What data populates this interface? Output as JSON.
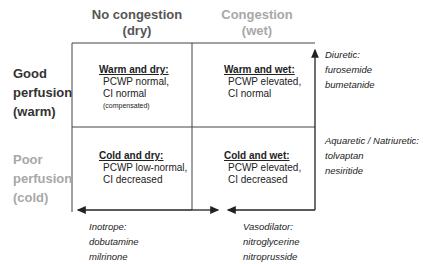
{
  "columns": [
    {
      "line1": "No congestion",
      "line2": "(dry)",
      "color": "#555555"
    },
    {
      "line1": "Congestion",
      "line2": "(wet)",
      "color": "#a8a8a8"
    }
  ],
  "rows": [
    {
      "line1": "Good",
      "line2": "perfusion",
      "line3": "(warm)",
      "color": "#333333"
    },
    {
      "line1": "Poor",
      "line2": "perfusion",
      "line3": "(cold)",
      "color": "#a8a8a8"
    }
  ],
  "cells": {
    "warm_dry": {
      "title": "Warm and dry:",
      "line1": "PCWP normal,",
      "line2": "CI normal",
      "note": "(compensated)"
    },
    "warm_wet": {
      "title": "Warm and wet:",
      "line1": "PCWP elevated,",
      "line2": "CI normal"
    },
    "cold_dry": {
      "title": "Cold and dry:",
      "line1": "PCWP low-normal,",
      "line2": "CI decreased"
    },
    "cold_wet": {
      "title": "Cold and wet:",
      "line1": "PCWP elevated,",
      "line2": "CI decreased"
    }
  },
  "therapies": {
    "diuretic": {
      "label": "Diuretic:",
      "drug1": "furosemide",
      "drug2": "bumetanide"
    },
    "aquaretic": {
      "label": "Aquaretic / Natriuretic:",
      "drug1": "tolvaptan",
      "drug2": "nesiritide"
    },
    "inotrope": {
      "label": "Inotrope:",
      "drug1": "dobutamine",
      "drug2": "milrinone"
    },
    "vasodilator": {
      "label": "Vasodilator:",
      "drug1": "nitroglycerine",
      "drug2": "nitroprusside"
    }
  }
}
